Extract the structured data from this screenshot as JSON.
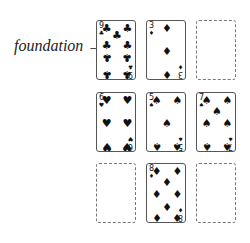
{
  "label": {
    "text": "foundation →"
  },
  "grid": {
    "rows": [
      [
        {
          "type": "card",
          "rank": "9",
          "suit": "clubs",
          "glyph": "♣"
        },
        {
          "type": "card",
          "rank": "3",
          "suit": "diamonds",
          "glyph": "♦"
        },
        {
          "type": "empty"
        }
      ],
      [
        {
          "type": "card",
          "rank": "6",
          "suit": "hearts",
          "glyph": "♥"
        },
        {
          "type": "card",
          "rank": "5",
          "suit": "spades",
          "glyph": "♠"
        },
        {
          "type": "card",
          "rank": "7",
          "suit": "spades",
          "glyph": "♠"
        }
      ],
      [
        {
          "type": "empty"
        },
        {
          "type": "card",
          "rank": "8",
          "suit": "diamonds",
          "glyph": "♦"
        },
        {
          "type": "empty"
        }
      ]
    ]
  },
  "colors": {
    "ink": "#111111",
    "border": "#555555",
    "empty_border": "#777777",
    "background": "#ffffff"
  }
}
